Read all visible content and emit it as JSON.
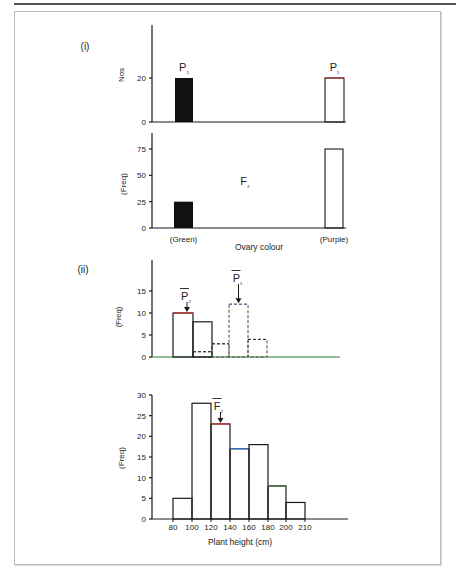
{
  "figure": {
    "part_labels": [
      "(i)",
      "(ii)"
    ],
    "colors": {
      "axis": "#1a1a1a",
      "filled_bar": "#111111",
      "p1_top": "#b03030",
      "f2_red": "#c0392b",
      "f2_blue": "#3a6fc4",
      "f2_green": "#3a7a3a",
      "dashed_top": "#9b4fb0"
    }
  },
  "chart_data": [
    {
      "id": "parental-ovary",
      "type": "bar",
      "title": "",
      "ylabel": "Nos",
      "xlabel": "",
      "categories": [
        "P2 (Green)",
        "P1 (Purple)"
      ],
      "values": [
        20,
        20
      ],
      "bar_labels": [
        "P₂",
        "P₁"
      ],
      "yticks": [
        0,
        20
      ],
      "ylim": [
        0,
        44
      ],
      "grid": false
    },
    {
      "id": "f2-ovary",
      "type": "bar",
      "title": "",
      "annotation": "F₂",
      "ylabel": "(Freq)",
      "xlabel": "Ovary colour",
      "categories": [
        "(Green)",
        "(Purple)"
      ],
      "values": [
        25,
        75
      ],
      "yticks": [
        0,
        25,
        50,
        75
      ],
      "ylim": [
        0,
        90
      ],
      "grid": false
    },
    {
      "id": "parental-height",
      "type": "bar",
      "title": "",
      "ylabel": "(Freq)",
      "xlabel": "",
      "series": [
        {
          "name": "P2 (solid)",
          "style": "solid",
          "bins": [
            "80-100",
            "100-120"
          ],
          "values": [
            10,
            8
          ]
        },
        {
          "name": "P1 (dashed)",
          "style": "dashed",
          "bins": [
            "100-120",
            "120-140",
            "140-160",
            "160-180"
          ],
          "values": [
            1.2,
            3,
            12,
            4
          ]
        }
      ],
      "annotations": [
        {
          "label": "P̅₂",
          "points_to_bin": "80-100"
        },
        {
          "label": "P̅₁",
          "points_to_bin": "140-160"
        }
      ],
      "yticks": [
        0,
        5,
        10,
        15
      ],
      "ylim": [
        0,
        20
      ],
      "grid": false
    },
    {
      "id": "f2-height",
      "type": "bar",
      "title": "",
      "ylabel": "(Freq)",
      "xlabel": "Plant height (cm)",
      "bins": [
        "80-100",
        "100-120",
        "120-140",
        "140-160",
        "160-180",
        "180-200",
        "200-210"
      ],
      "values": [
        5,
        28,
        23,
        17,
        18,
        8,
        4
      ],
      "xticks": [
        80,
        100,
        120,
        140,
        160,
        180,
        200,
        210
      ],
      "yticks": [
        0,
        5,
        10,
        15,
        20,
        25,
        30
      ],
      "ylim": [
        0,
        30
      ],
      "annotation": {
        "label": "F̅₂",
        "points_to_bin": "120-140"
      },
      "grid": false
    }
  ]
}
